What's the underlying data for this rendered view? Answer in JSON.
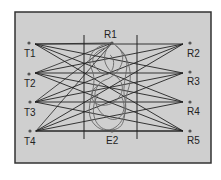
{
  "diagram": {
    "title": "",
    "frame": {
      "x": 15,
      "y": 12,
      "w": 196,
      "h": 151,
      "fill": "#cfcfcf",
      "stroke": "#333333"
    },
    "transmitters": [
      {
        "label": "T1",
        "dot": [
          29,
          43
        ],
        "anchor": [
          35,
          44
        ]
      },
      {
        "label": "T2",
        "dot": [
          29,
          74
        ],
        "anchor": [
          35,
          73
        ]
      },
      {
        "label": "T3",
        "dot": [
          30,
          102
        ],
        "anchor": [
          35,
          102
        ]
      },
      {
        "label": "T4",
        "dot": [
          30,
          131
        ],
        "anchor": [
          36,
          131
        ]
      }
    ],
    "receivers": [
      {
        "label": "R1",
        "dot": [
          112,
          43
        ],
        "anchor": [
          112,
          43
        ]
      },
      {
        "label": "R2",
        "dot": [
          190,
          43
        ],
        "anchor": [
          183,
          44
        ]
      },
      {
        "label": "R3",
        "dot": [
          190,
          72
        ],
        "anchor": [
          183,
          73
        ]
      },
      {
        "label": "R4",
        "dot": [
          190,
          102
        ],
        "anchor": [
          183,
          102
        ]
      },
      {
        "label": "R5",
        "dot": [
          190,
          131
        ],
        "anchor": [
          183,
          131
        ]
      }
    ],
    "emitter": {
      "label": "E2",
      "dot": [
        112,
        131
      ]
    },
    "vertical_lines": [
      {
        "x": 84,
        "y1": 35,
        "y2": 139
      },
      {
        "x": 137,
        "y1": 35,
        "y2": 139
      }
    ],
    "colors": {
      "line": "#222222",
      "path": "#666666",
      "dot": "#555555"
    }
  }
}
